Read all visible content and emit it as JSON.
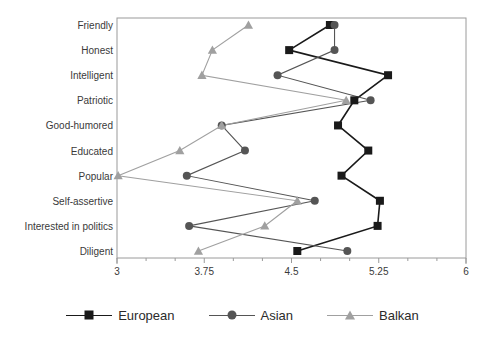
{
  "chart_data": {
    "type": "line",
    "title": "",
    "subtitle": "",
    "xlabel": "",
    "ylabel": "",
    "orientation": "horizontal",
    "categories": [
      "Friendly",
      "Honest",
      "Intelligent",
      "Patriotic",
      "Good-humored",
      "Educated",
      "Popular",
      "Self-assertive",
      "Interested in politics",
      "Diligent"
    ],
    "xlim": [
      3,
      6
    ],
    "xticks": [
      3,
      3.75,
      4.5,
      5.25,
      6
    ],
    "xtick_labels": [
      "3",
      "3.75",
      "4.5",
      "5.25",
      "6"
    ],
    "minor_tick_step": 0.25,
    "grid": false,
    "legend_position": "bottom",
    "series": [
      {
        "name": "European",
        "marker": "square",
        "color": "#1a1a1a",
        "values": [
          4.83,
          4.48,
          5.33,
          5.04,
          4.9,
          5.16,
          4.93,
          5.26,
          5.24,
          4.55
        ]
      },
      {
        "name": "Asian",
        "marker": "circle",
        "color": "#555555",
        "values": [
          4.87,
          4.87,
          4.38,
          5.18,
          3.9,
          4.1,
          3.6,
          4.7,
          3.62,
          4.98
        ]
      },
      {
        "name": "Balkan",
        "marker": "triangle",
        "color": "#a0a0a0",
        "values": [
          4.13,
          3.82,
          3.73,
          4.97,
          3.9,
          3.54,
          3.01,
          4.55,
          4.27,
          3.7
        ]
      }
    ]
  },
  "legend": {
    "items": [
      {
        "label": "European"
      },
      {
        "label": "Asian"
      },
      {
        "label": "Balkan"
      }
    ]
  },
  "colors": {
    "european": "#1a1a1a",
    "asian": "#555555",
    "balkan": "#a0a0a0",
    "axis": "#9a9a9a",
    "text": "#3a3a3a",
    "background": "#ffffff"
  }
}
